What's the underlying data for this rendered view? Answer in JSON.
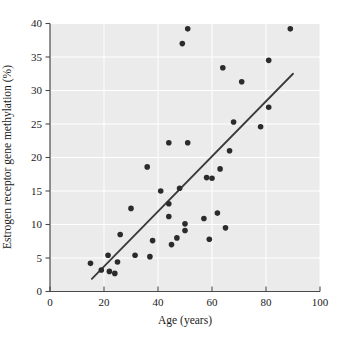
{
  "figure": {
    "xlabel": "Age (years)",
    "ylabel": "Estrogen receptor gene methylation (%)"
  },
  "chart_data": {
    "type": "scatter",
    "title": "",
    "xlabel": "Age (years)",
    "ylabel": "Estrogen receptor gene methylation (%)",
    "xlim": [
      0,
      100
    ],
    "ylim": [
      0,
      40
    ],
    "xticks": [
      0,
      20,
      40,
      60,
      80,
      100
    ],
    "yticks": [
      0,
      5,
      10,
      15,
      20,
      25,
      30,
      35,
      40
    ],
    "grid": true,
    "legend_position": "none",
    "series": [
      {
        "name": "methylation-vs-age",
        "points": [
          [
            15,
            4.2
          ],
          [
            19,
            3.2
          ],
          [
            21.5,
            5.4
          ],
          [
            22,
            3.0
          ],
          [
            24,
            2.7
          ],
          [
            25,
            4.4
          ],
          [
            26,
            8.5
          ],
          [
            30,
            12.4
          ],
          [
            31.5,
            5.4
          ],
          [
            36,
            18.6
          ],
          [
            37,
            5.2
          ],
          [
            38,
            7.6
          ],
          [
            41,
            15.0
          ],
          [
            44,
            22.2
          ],
          [
            44,
            13.1
          ],
          [
            44,
            11.2
          ],
          [
            45,
            7.0
          ],
          [
            47,
            8.0
          ],
          [
            48,
            15.4
          ],
          [
            49,
            37.0
          ],
          [
            50,
            10.1
          ],
          [
            50,
            9.1
          ],
          [
            51,
            39.2
          ],
          [
            51,
            22.2
          ],
          [
            57,
            10.9
          ],
          [
            58,
            17.0
          ],
          [
            59,
            7.8
          ],
          [
            60,
            16.9
          ],
          [
            62,
            11.7
          ],
          [
            63,
            18.3
          ],
          [
            64,
            33.4
          ],
          [
            65,
            9.5
          ],
          [
            66.5,
            21.0
          ],
          [
            68,
            25.3
          ],
          [
            71,
            31.3
          ],
          [
            78,
            24.6
          ],
          [
            81,
            34.5
          ],
          [
            81,
            27.5
          ],
          [
            89,
            39.2
          ]
        ]
      }
    ],
    "trend_line": {
      "x1": 15.5,
      "y1": 1.9,
      "x2": 90,
      "y2": 32.5
    },
    "colors": {
      "panel": "#ebebeb",
      "grid": "#ffffff",
      "point": "#2b2b2b",
      "trend": "#3a3a3a",
      "spine": "#4a4a4a",
      "text": "#1a1a1a"
    }
  }
}
